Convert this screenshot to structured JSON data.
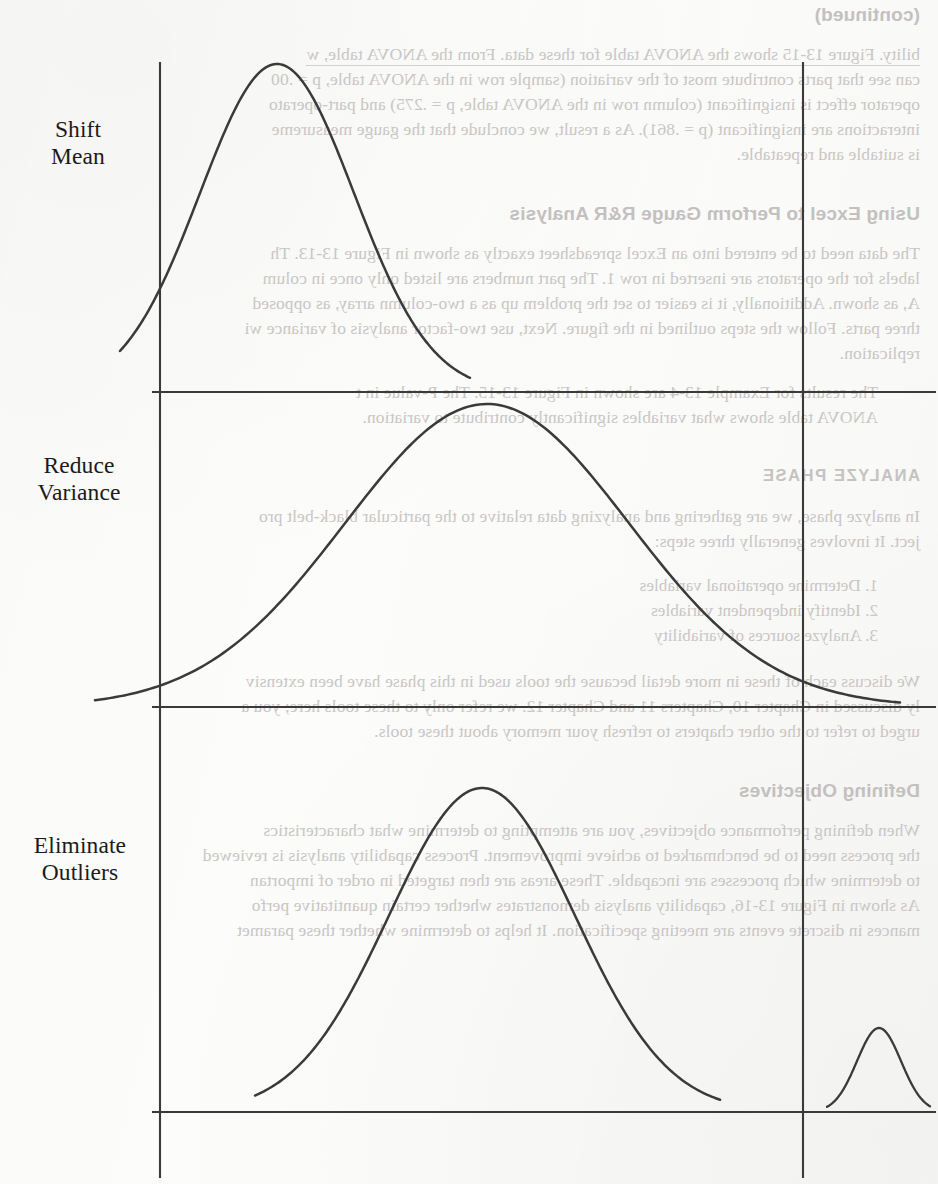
{
  "page": {
    "kind": "scanned-book-figure-page",
    "width": 938,
    "height": 1184,
    "ink_color": "#3a3a3a",
    "paper_color": "#fcfcfb",
    "showthrough_color": "#c9c6c4"
  },
  "figure": {
    "labels": [
      {
        "line1": "Shift",
        "line2": "Mean"
      },
      {
        "line1": "Reduce",
        "line2": "Variance"
      },
      {
        "line1": "Eliminate",
        "line2": "Outliers"
      }
    ]
  },
  "chart_data": {
    "type": "line",
    "title": "",
    "xlabel": "",
    "ylabel": "",
    "grid": false,
    "legend_position": "left",
    "annotations": [
      "Shift Mean",
      "Reduce Variance",
      "Eliminate Outliers"
    ],
    "reference_lines": {
      "vertical": [
        160,
        803
      ],
      "horizontal": [
        392,
        707,
        1112
      ]
    },
    "panels": [
      {
        "name": "Shift Mean",
        "label_line1": "Shift",
        "label_line2": "Mean",
        "baseline_y": 392,
        "lsl_x": 160,
        "usl_x": 803,
        "series": [
          {
            "name": "distribution",
            "mean_x": 277,
            "sigma_x": 77,
            "peak_y": 64,
            "amplitude": 328,
            "x_from": 120,
            "x_to": 470,
            "comment": "narrow bell shifted left of the centre, tail crosses the lower spec line"
          }
        ]
      },
      {
        "name": "Reduce Variance",
        "label_line1": "Reduce",
        "label_line2": "Variance",
        "baseline_y": 707,
        "lsl_x": 160,
        "usl_x": 803,
        "series": [
          {
            "name": "distribution",
            "mean_x": 487,
            "sigma_x": 142,
            "peak_y": 404,
            "amplitude": 303,
            "x_from": 95,
            "x_to": 900,
            "comment": "wide bell centred between the spec lines, tails run past both limits"
          }
        ]
      },
      {
        "name": "Eliminate Outliers",
        "label_line1": "Eliminate",
        "label_line2": "Outliers",
        "baseline_y": 1112,
        "lsl_x": 160,
        "usl_x": 803,
        "series": [
          {
            "name": "main-distribution",
            "mean_x": 482,
            "sigma_x": 93,
            "peak_y": 788,
            "amplitude": 324,
            "x_from": 255,
            "x_to": 720,
            "comment": "medium bell well inside the spec lines"
          },
          {
            "name": "outlier-cluster",
            "mean_x": 879,
            "sigma_x": 22,
            "peak_y": 1028,
            "amplitude": 84,
            "x_from": 827,
            "x_to": 930,
            "comment": "small bump outside the upper spec line"
          }
        ]
      }
    ]
  },
  "showthrough": {
    "note": "mirrored text bleeding through from the reverse side of the sheet; rendered horizontally flipped",
    "lines": [
      {
        "t": "(continued)",
        "x": 18,
        "y": 4,
        "cls": "head",
        "scale": 1
      },
      {
        "t": "bility.  Figure 13-15 shows the ANOVA table for these data.  From the ANOVA table, w",
        "x": 18,
        "y": 44,
        "cls": "ghost ul"
      },
      {
        "t": "can see that parts contribute most of the variation (sample row in the ANOVA table, p = .00",
        "x": 18,
        "y": 69,
        "cls": "ghost"
      },
      {
        "t": "operator effect is insignificant (column row in the ANOVA table, p = .275) and part-operato",
        "x": 18,
        "y": 94,
        "cls": "ghost"
      },
      {
        "t": "interactions are insignificant (p = .861).  As a result, we conclude that the gauge measureme",
        "x": 18,
        "y": 119,
        "cls": "ghost"
      },
      {
        "t": "is suitable and repeatable.",
        "x": 18,
        "y": 144,
        "cls": "ghost"
      },
      {
        "t": "Using Excel to Perform Gauge R&R Analysis",
        "x": 18,
        "y": 203,
        "cls": "head"
      },
      {
        "t": "The data need to be entered into an Excel spreadsheet exactly as shown in Figure 13-13.  Th",
        "x": 18,
        "y": 243,
        "cls": "ghost"
      },
      {
        "t": "labels for the operators are inserted in row 1.  The part numbers are listed only once in colum",
        "x": 18,
        "y": 268,
        "cls": "ghost"
      },
      {
        "t": "A, as shown.  Additionally, it is easier to set the problem up as a two-column array, as opposed",
        "x": 18,
        "y": 293,
        "cls": "ghost"
      },
      {
        "t": "three parts.  Follow the steps outlined in the figure.  Next, use two-factor analysis of variance  wi",
        "x": 18,
        "y": 318,
        "cls": "ghost"
      },
      {
        "t": "replication.",
        "x": 18,
        "y": 343,
        "cls": "ghost"
      },
      {
        "t": "The results for Example 13-4 are shown in Figure 13-15.  The P-value in t",
        "x": 60,
        "y": 382,
        "cls": "ghost"
      },
      {
        "t": "ANOVA table shows what variables significantly contribute to variation.",
        "x": 60,
        "y": 407,
        "cls": "ghost"
      },
      {
        "t": "ANALYZE PHASE",
        "x": 18,
        "y": 466,
        "cls": "head2"
      },
      {
        "t": "In analyze phase, we are gathering and analyzing data relative to the particular black-belt pro",
        "x": 18,
        "y": 506,
        "cls": "ghost"
      },
      {
        "t": "ject.  It involves generally three steps:",
        "x": 18,
        "y": 531,
        "cls": "ghost"
      },
      {
        "t": "1.  Determine operational variables",
        "x": 60,
        "y": 576,
        "cls": "ghost bul"
      },
      {
        "t": "2.  Identify independent variables",
        "x": 60,
        "y": 601,
        "cls": "ghost bul"
      },
      {
        "t": "3.  Analyze sources of variability",
        "x": 60,
        "y": 626,
        "cls": "ghost bul"
      },
      {
        "t": "We discuss each of these in more detail because the tools used in this phase have been extensiv",
        "x": 18,
        "y": 671,
        "cls": "ghost"
      },
      {
        "t": "ly discussed in Chapter 10, Chapters 11 and Chapter 12.  we refer only to these tools here; you a",
        "x": 18,
        "y": 696,
        "cls": "ghost"
      },
      {
        "t": "urged to refer to the other chapters to refresh your memory about these tools.",
        "x": 18,
        "y": 721,
        "cls": "ghost"
      },
      {
        "t": "Defining Objectives",
        "x": 18,
        "y": 780,
        "cls": "head"
      },
      {
        "t": "When defining performance objectives, you are attempting to determine what characteristics",
        "x": 18,
        "y": 820,
        "cls": "ghost"
      },
      {
        "t": "the process need to be benchmarked to achieve improvement.  Process capability analysis is reviewed",
        "x": 18,
        "y": 845,
        "cls": "ghost"
      },
      {
        "t": "to determine which processes are incapable.  These areas are then targeted in order of importan",
        "x": 18,
        "y": 870,
        "cls": "ghost"
      },
      {
        "t": "As shown in Figure 13-16, capability analysis demonstrates whether certain quantitative perfo",
        "x": 18,
        "y": 895,
        "cls": "ghost"
      },
      {
        "t": "mances in discrete events are meeting specification.  It helps to determine whether these paramet",
        "x": 18,
        "y": 920,
        "cls": "ghost"
      }
    ]
  }
}
